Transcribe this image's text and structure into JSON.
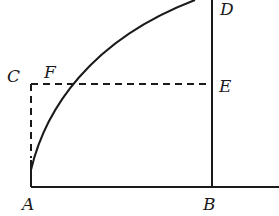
{
  "figure": {
    "type": "geometric-construction",
    "points": {
      "A": {
        "label": "A",
        "x": 31,
        "y": 187
      },
      "B": {
        "label": "B",
        "x": 212,
        "y": 187
      },
      "C": {
        "label": "C",
        "x": 31,
        "y": 84
      },
      "D": {
        "label": "D",
        "x": 212,
        "y": 0
      },
      "E": {
        "label": "E",
        "x": 212,
        "y": 84
      },
      "F": {
        "label": "F",
        "x": 60,
        "y": 84
      }
    },
    "labels": {
      "A": "A",
      "B": "B",
      "C": "C",
      "D": "D",
      "E": "E",
      "F": "F"
    },
    "elements": [
      {
        "kind": "line",
        "style": "solid",
        "from": "A",
        "to": "B",
        "extends_past": "B"
      },
      {
        "kind": "line",
        "style": "solid",
        "from": "B",
        "to": "D"
      },
      {
        "kind": "arc",
        "style": "solid",
        "from": "A",
        "to": "D",
        "through": "F"
      },
      {
        "kind": "line",
        "style": "dashed",
        "from": "C",
        "to": "E"
      },
      {
        "kind": "line",
        "style": "dashed",
        "from": "C",
        "toward": "A"
      }
    ],
    "colors": {
      "ink": "#1a1a1a",
      "background": "#ffffff"
    }
  }
}
